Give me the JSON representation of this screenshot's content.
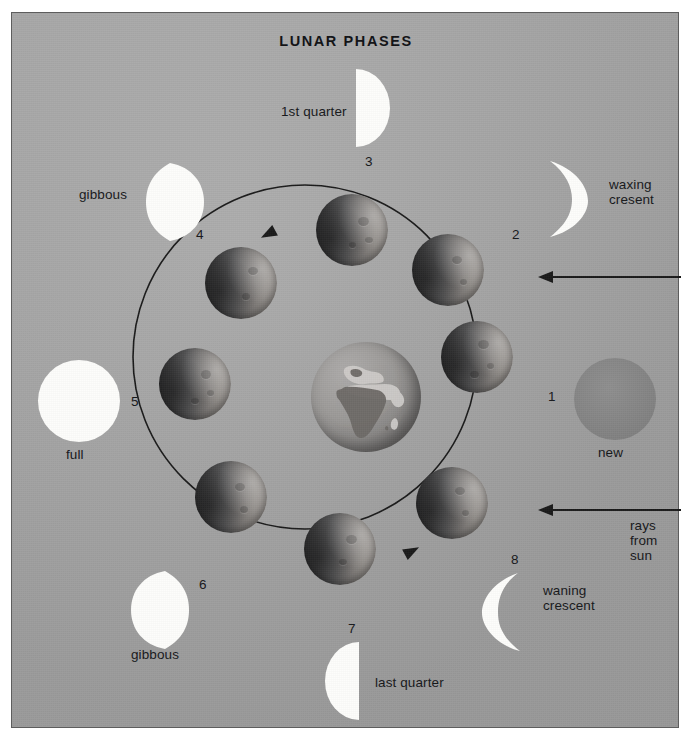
{
  "title": "LUNAR PHASES",
  "diagram": {
    "center_body": "earth",
    "orbit_direction": "counterclockwise",
    "sun_direction": "from the right"
  },
  "phases": [
    {
      "number": "1",
      "label": "new",
      "kind": "new",
      "position": "right"
    },
    {
      "number": "2",
      "label": "waxing\ncresent",
      "kind": "crescent-right",
      "position": "upper-right"
    },
    {
      "number": "3",
      "label": "1st quarter",
      "kind": "half-right",
      "position": "top"
    },
    {
      "number": "4",
      "label": "gibbous",
      "kind": "gibbous-right",
      "position": "upper-left"
    },
    {
      "number": "5",
      "label": "full",
      "kind": "full",
      "position": "left"
    },
    {
      "number": "6",
      "label": "gibbous",
      "kind": "gibbous-left",
      "position": "lower-left"
    },
    {
      "number": "7",
      "label": "last quarter",
      "kind": "half-left",
      "position": "bottom"
    },
    {
      "number": "8",
      "label": "waning\ncrescent",
      "kind": "crescent-left",
      "position": "lower-right"
    }
  ],
  "annotations": {
    "rays_label": "rays\nfrom\nsun",
    "arrow_top": "",
    "arrow_bottom": ""
  },
  "colors": {
    "background": "#a5a5a5",
    "lit_moon": "#fdfdfb",
    "new_moon": "#848484",
    "ink": "#16171a",
    "frame": "#5d5d5d"
  }
}
